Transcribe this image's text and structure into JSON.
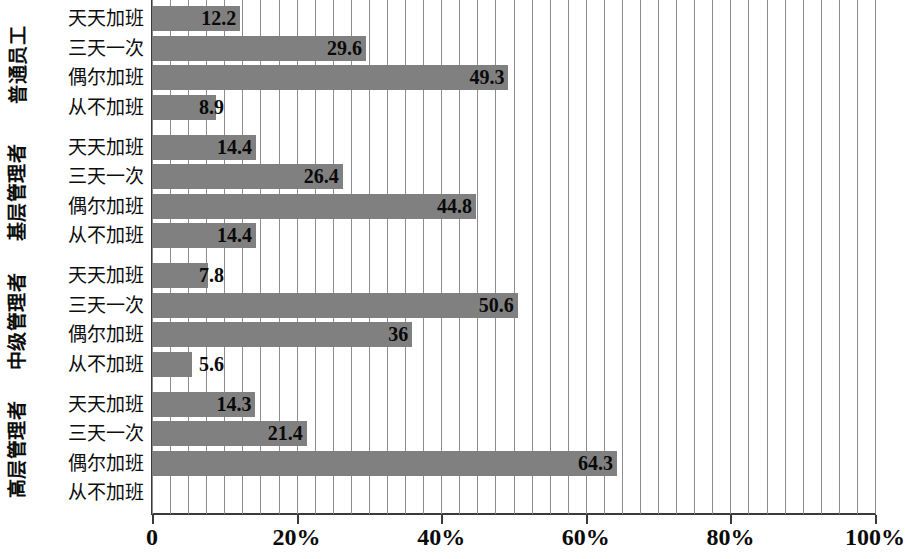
{
  "chart_data": {
    "type": "bar",
    "orientation": "horizontal",
    "title": "",
    "subtitle": "",
    "xlabel": "",
    "ylabel": "",
    "xlim": [
      0,
      100
    ],
    "xticks": [
      0,
      20,
      40,
      60,
      80,
      100
    ],
    "xticklabels": [
      "0",
      "20%",
      "40%",
      "60%",
      "80%",
      "100%"
    ],
    "minor_tick_step": 2.5,
    "grid": "vertical",
    "legend": "none",
    "bar_color": "#808080",
    "gridline_color": "#8c8c8c",
    "axis_color": "#3a3a3a",
    "categories": [
      "天天加班",
      "三天一次",
      "偶尔加班",
      "从不加班"
    ],
    "groups": [
      {
        "name": "普通员工",
        "categories": [
          "天天加班",
          "三天一次",
          "偶尔加班",
          "从不加班"
        ],
        "values": [
          12.2,
          29.6,
          49.3,
          8.9
        ],
        "labels": [
          "12.2",
          "29.6",
          "49.3",
          "8.9"
        ]
      },
      {
        "name": "基层管理者",
        "categories": [
          "天天加班",
          "三天一次",
          "偶尔加班",
          "从不加班"
        ],
        "values": [
          14.4,
          26.4,
          44.8,
          14.4
        ],
        "labels": [
          "14.4",
          "26.4",
          "44.8",
          "14.4"
        ]
      },
      {
        "name": "中级管理者",
        "categories": [
          "天天加班",
          "三天一次",
          "偶尔加班",
          "从不加班"
        ],
        "values": [
          7.8,
          50.6,
          36,
          5.6
        ],
        "labels": [
          "7.8",
          "50.6",
          "36",
          "5.6"
        ]
      },
      {
        "name": "高层管理者",
        "categories": [
          "天天加班",
          "三天一次",
          "偶尔加班",
          "从不加班"
        ],
        "values": [
          14.3,
          21.4,
          64.3,
          0
        ],
        "labels": [
          "14.3",
          "21.4",
          "64.3",
          ""
        ]
      }
    ]
  }
}
